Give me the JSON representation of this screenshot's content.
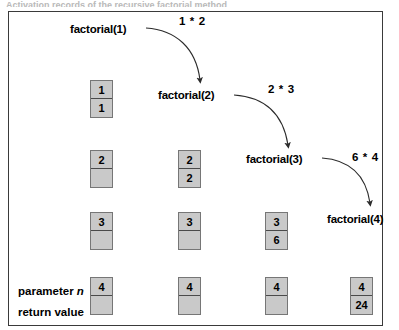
{
  "caption": "Activation records of the recursive factorial method",
  "diagram": {
    "type": "recursion-trace",
    "border_color": "#3a3a3a",
    "box_fill": "#c9c9c9",
    "box_border": "#767676",
    "calls": [
      {
        "label": "factorial(1)",
        "x": 70,
        "y": 22
      },
      {
        "label": "factorial(2)",
        "x": 158,
        "y": 88
      },
      {
        "label": "factorial(3)",
        "x": 246,
        "y": 152
      },
      {
        "label": "factorial(4)",
        "x": 327,
        "y": 212
      }
    ],
    "multiplications": [
      {
        "label": "1 * 2",
        "x": 179,
        "y": 14
      },
      {
        "label": "2 * 3",
        "x": 268,
        "y": 82
      },
      {
        "label": "6 * 4",
        "x": 352,
        "y": 150
      }
    ],
    "row_legend": [
      {
        "prefix": "parameter ",
        "italic": "n",
        "x": 18,
        "y": 284
      },
      {
        "prefix": "return value",
        "italic": "",
        "x": 18,
        "y": 305
      }
    ],
    "columns_x": [
      90,
      178,
      265,
      350
    ],
    "rows": [
      {
        "stack_depth": 1,
        "y": 80,
        "records": [
          {
            "col": 0,
            "parameter": "1",
            "return": "1"
          }
        ]
      },
      {
        "stack_depth": 2,
        "y": 150,
        "records": [
          {
            "col": 0,
            "parameter": "2",
            "return": ""
          },
          {
            "col": 1,
            "parameter": "2",
            "return": "2"
          }
        ]
      },
      {
        "stack_depth": 3,
        "y": 212,
        "records": [
          {
            "col": 0,
            "parameter": "3",
            "return": ""
          },
          {
            "col": 1,
            "parameter": "3",
            "return": ""
          },
          {
            "col": 2,
            "parameter": "3",
            "return": "6"
          }
        ]
      },
      {
        "stack_depth": 4,
        "y": 277,
        "records": [
          {
            "col": 0,
            "parameter": "4",
            "return": ""
          },
          {
            "col": 1,
            "parameter": "4",
            "return": ""
          },
          {
            "col": 2,
            "parameter": "4",
            "return": ""
          },
          {
            "col": 3,
            "parameter": "4",
            "return": "24"
          }
        ]
      }
    ],
    "arrows": [
      {
        "name": "arrow-1-to-2",
        "path": "M 146,28 C 176,30 196,48 200,80"
      },
      {
        "name": "arrow-2-to-3",
        "path": "M 234,95 C 264,97 283,113 288,145"
      },
      {
        "name": "arrow-3-to-4",
        "path": "M 322,158 C 350,160 366,176 370,203"
      }
    ]
  }
}
